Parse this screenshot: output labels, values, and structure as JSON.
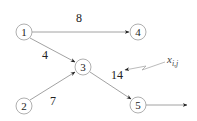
{
  "diagram": {
    "type": "network-flow",
    "nodes": [
      {
        "id": "1",
        "label": "1",
        "cx": 24,
        "cy": 32
      },
      {
        "id": "2",
        "label": "2",
        "cx": 24,
        "cy": 106
      },
      {
        "id": "3",
        "label": "3",
        "cx": 83,
        "cy": 67
      },
      {
        "id": "4",
        "label": "4",
        "cx": 138,
        "cy": 32
      },
      {
        "id": "5",
        "label": "5",
        "cx": 138,
        "cy": 105
      }
    ],
    "edges": [
      {
        "from": "1",
        "to": "4",
        "label": "8"
      },
      {
        "from": "1",
        "to": "3",
        "label": "4"
      },
      {
        "from": "2",
        "to": "3",
        "label": "7"
      },
      {
        "from": "3",
        "to": "5",
        "label": "14"
      },
      {
        "from": "5",
        "to": "out",
        "label": ""
      }
    ],
    "annotation": {
      "text": "x",
      "subscript": "i,j",
      "points_to_label": "14"
    }
  }
}
